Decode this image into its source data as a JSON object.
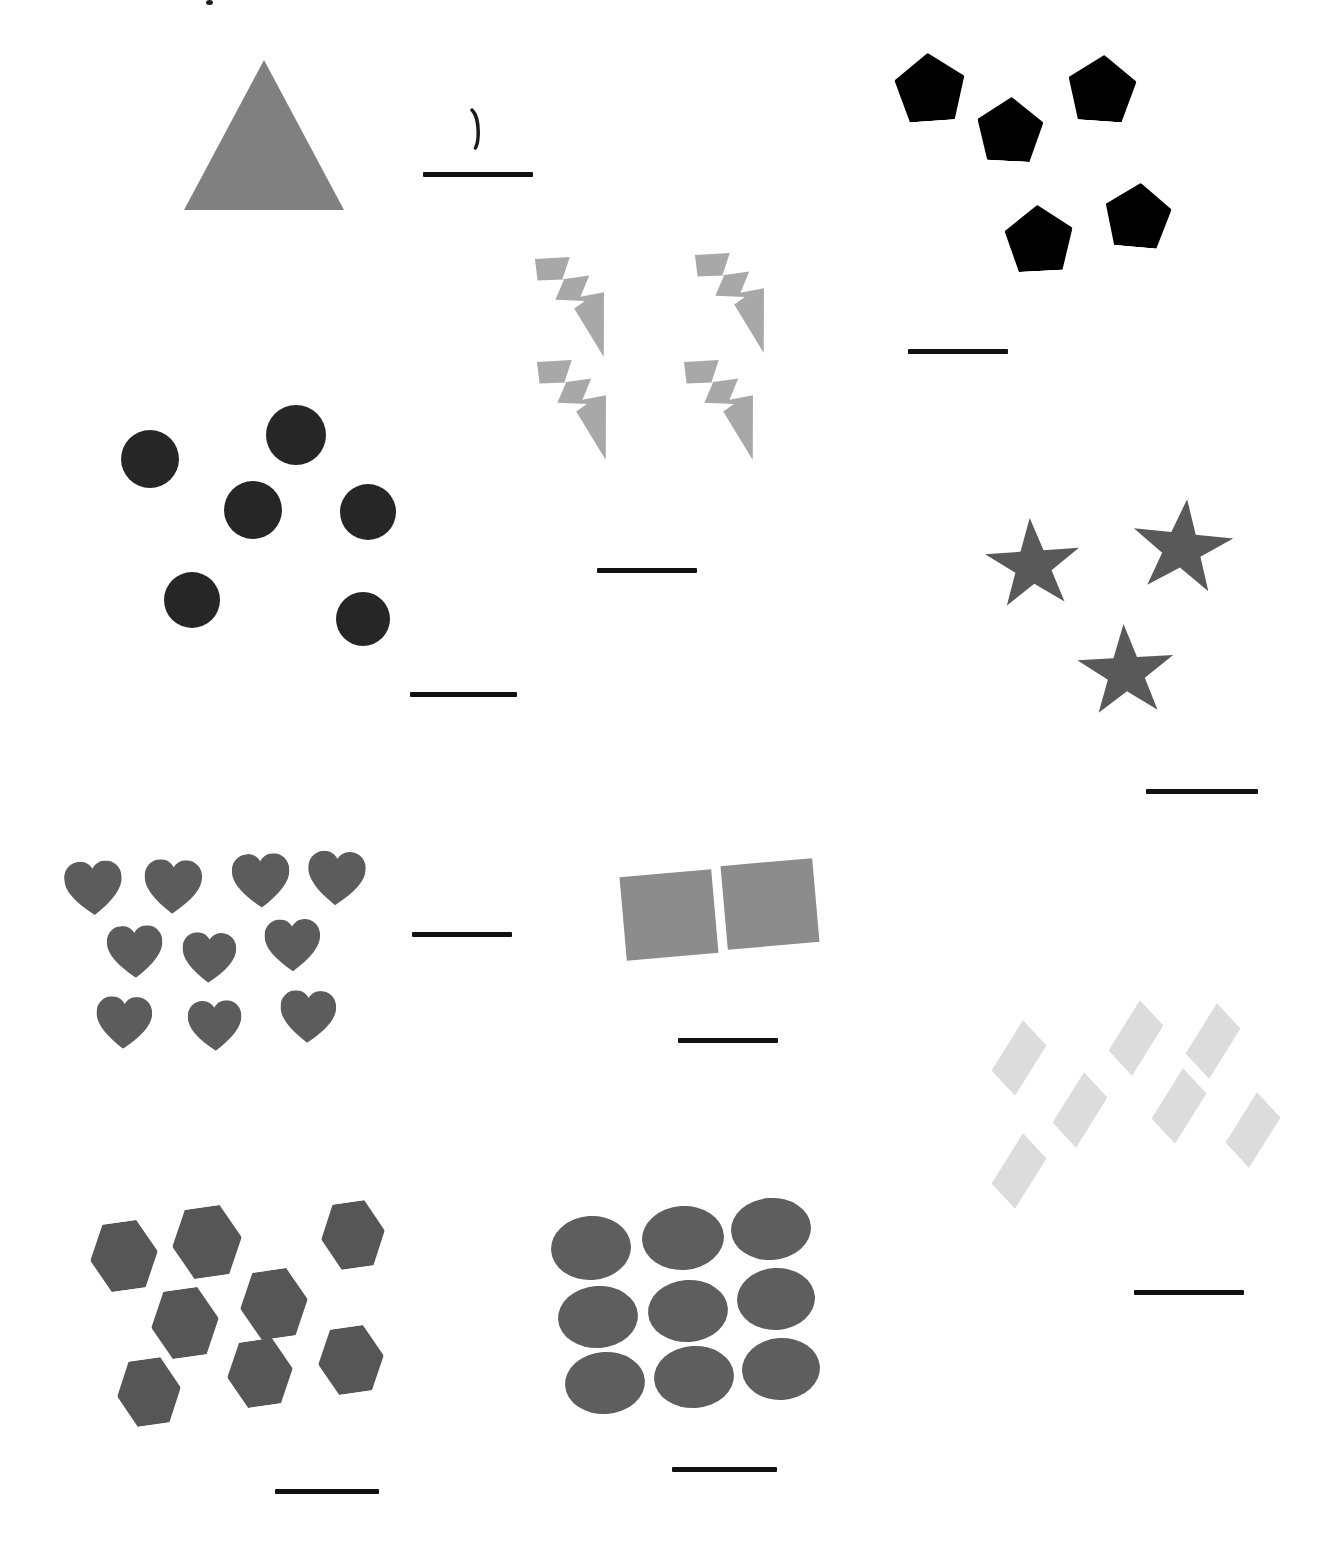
{
  "worksheet": {
    "title": "Counting Shapes Worksheet",
    "page_background": "#ffffff",
    "width": 1331,
    "height": 1554,
    "answer_line_color": "#111111"
  },
  "handwriting": {
    "mark_label": "1",
    "description": "handwritten pen stroke above first answer line",
    "color": "#1a1a1a"
  },
  "groups": [
    {
      "id": "triangle-group",
      "shape_name": "triangle",
      "shape_label": "Triangle",
      "count": 1,
      "color": "#808080",
      "answer_value": "",
      "answer_placeholder": ""
    },
    {
      "id": "pentagon-group",
      "shape_name": "pentagon",
      "shape_label": "Pentagon",
      "count": 5,
      "color": "#000000",
      "answer_value": "",
      "answer_placeholder": ""
    },
    {
      "id": "bolt-group",
      "shape_name": "lightning-bolt",
      "shape_label": "Lightning Bolt",
      "count": 4,
      "color": "#a8a8a8",
      "answer_value": "",
      "answer_placeholder": ""
    },
    {
      "id": "circle-group",
      "shape_name": "circle",
      "shape_label": "Circle",
      "count": 6,
      "color": "#262626",
      "answer_value": "",
      "answer_placeholder": ""
    },
    {
      "id": "star-group",
      "shape_name": "star",
      "shape_label": "Star",
      "count": 3,
      "color": "#595959",
      "answer_value": "",
      "answer_placeholder": ""
    },
    {
      "id": "heart-group",
      "shape_name": "heart",
      "shape_label": "Heart",
      "count": 10,
      "color": "#5c5c5c",
      "answer_value": "",
      "answer_placeholder": ""
    },
    {
      "id": "square-group",
      "shape_name": "square",
      "shape_label": "Square",
      "count": 2,
      "color": "#8c8c8c",
      "answer_value": "",
      "answer_placeholder": ""
    },
    {
      "id": "diamond-group",
      "shape_name": "diamond",
      "shape_label": "Diamond",
      "count": 7,
      "color": "#dcdcdc",
      "answer_value": "",
      "answer_placeholder": ""
    },
    {
      "id": "hexagon-group",
      "shape_name": "hexagon",
      "shape_label": "Hexagon",
      "count": 8,
      "color": "#565656",
      "answer_value": "",
      "answer_placeholder": ""
    },
    {
      "id": "ellipse-group",
      "shape_name": "ellipse",
      "shape_label": "Ellipse",
      "count": 9,
      "color": "#5e5e5e",
      "answer_value": "",
      "answer_placeholder": ""
    }
  ],
  "layout": {
    "triangle": {
      "items": [
        {
          "x": 184,
          "y": 60,
          "w": 160,
          "h": 150,
          "rot": 0
        }
      ],
      "line": {
        "x": 423,
        "y": 172,
        "w": 110
      }
    },
    "pentagon": {
      "items": [
        {
          "x": 895,
          "y": 53,
          "w": 70,
          "h": 68,
          "rot": -4
        },
        {
          "x": 977,
          "y": 97,
          "w": 66,
          "h": 64,
          "rot": 3
        },
        {
          "x": 1068,
          "y": 55,
          "w": 68,
          "h": 66,
          "rot": 4
        },
        {
          "x": 1005,
          "y": 205,
          "w": 68,
          "h": 66,
          "rot": -3
        },
        {
          "x": 1105,
          "y": 183,
          "w": 66,
          "h": 64,
          "rot": 5
        }
      ],
      "line": {
        "x": 908,
        "y": 349,
        "w": 100
      }
    },
    "bolt": {
      "items": [
        {
          "x": 527,
          "y": 257,
          "w": 82,
          "h": 96,
          "rot": 6
        },
        {
          "x": 687,
          "y": 253,
          "w": 82,
          "h": 96,
          "rot": 6
        },
        {
          "x": 529,
          "y": 360,
          "w": 82,
          "h": 96,
          "rot": 6
        },
        {
          "x": 676,
          "y": 360,
          "w": 82,
          "h": 96,
          "rot": 6
        }
      ],
      "line": {
        "x": 597,
        "y": 568,
        "w": 100
      }
    },
    "circle": {
      "items": [
        {
          "x": 121,
          "y": 430,
          "w": 58,
          "h": 58,
          "rot": 0
        },
        {
          "x": 266,
          "y": 405,
          "w": 60,
          "h": 60,
          "rot": 0
        },
        {
          "x": 224,
          "y": 481,
          "w": 58,
          "h": 58,
          "rot": 0
        },
        {
          "x": 340,
          "y": 484,
          "w": 56,
          "h": 56,
          "rot": 0
        },
        {
          "x": 164,
          "y": 572,
          "w": 56,
          "h": 56,
          "rot": 0
        },
        {
          "x": 336,
          "y": 592,
          "w": 54,
          "h": 54,
          "rot": 0
        }
      ],
      "line": {
        "x": 410,
        "y": 692,
        "w": 107
      }
    },
    "star": {
      "items": [
        {
          "x": 984,
          "y": 518,
          "w": 98,
          "h": 94,
          "rot": -4
        },
        {
          "x": 1130,
          "y": 499,
          "w": 104,
          "h": 98,
          "rot": 6
        },
        {
          "x": 1076,
          "y": 624,
          "w": 100,
          "h": 96,
          "rot": -3
        }
      ],
      "line": {
        "x": 1146,
        "y": 789,
        "w": 112
      }
    },
    "heart": {
      "items": [
        {
          "x": 62,
          "y": 861,
          "w": 60,
          "h": 58,
          "rot": -3
        },
        {
          "x": 144,
          "y": 857,
          "w": 60,
          "h": 58,
          "rot": 2
        },
        {
          "x": 230,
          "y": 853,
          "w": 60,
          "h": 58,
          "rot": -2
        },
        {
          "x": 308,
          "y": 848,
          "w": 60,
          "h": 58,
          "rot": 3
        },
        {
          "x": 105,
          "y": 925,
          "w": 58,
          "h": 56,
          "rot": -2
        },
        {
          "x": 182,
          "y": 930,
          "w": 56,
          "h": 54,
          "rot": 2
        },
        {
          "x": 263,
          "y": 918,
          "w": 58,
          "h": 56,
          "rot": -1
        },
        {
          "x": 96,
          "y": 994,
          "w": 58,
          "h": 56,
          "rot": 2
        },
        {
          "x": 186,
          "y": 1000,
          "w": 56,
          "h": 54,
          "rot": -2
        },
        {
          "x": 280,
          "y": 988,
          "w": 58,
          "h": 56,
          "rot": 2
        }
      ],
      "line": {
        "x": 412,
        "y": 932,
        "w": 100
      }
    },
    "square": {
      "items": [
        {
          "x": 623,
          "y": 873,
          "w": 92,
          "h": 84,
          "rot": -5
        },
        {
          "x": 724,
          "y": 862,
          "w": 92,
          "h": 84,
          "rot": -5
        }
      ],
      "line": {
        "x": 678,
        "y": 1038,
        "w": 100
      }
    },
    "diamond": {
      "items": [
        {
          "x": 993,
          "y": 1020,
          "w": 52,
          "h": 76,
          "rot": 6
        },
        {
          "x": 1110,
          "y": 1000,
          "w": 52,
          "h": 76,
          "rot": 6
        },
        {
          "x": 1187,
          "y": 1003,
          "w": 52,
          "h": 76,
          "rot": 6
        },
        {
          "x": 1054,
          "y": 1072,
          "w": 52,
          "h": 76,
          "rot": 6
        },
        {
          "x": 1153,
          "y": 1068,
          "w": 52,
          "h": 76,
          "rot": 6
        },
        {
          "x": 1227,
          "y": 1092,
          "w": 52,
          "h": 76,
          "rot": 6
        },
        {
          "x": 993,
          "y": 1133,
          "w": 52,
          "h": 76,
          "rot": 6
        }
      ],
      "line": {
        "x": 1134,
        "y": 1290,
        "w": 110
      }
    },
    "hexagon": {
      "items": [
        {
          "x": 90,
          "y": 1220,
          "w": 68,
          "h": 72,
          "rot": -8
        },
        {
          "x": 172,
          "y": 1205,
          "w": 70,
          "h": 74,
          "rot": -8
        },
        {
          "x": 321,
          "y": 1200,
          "w": 64,
          "h": 70,
          "rot": -8
        },
        {
          "x": 151,
          "y": 1287,
          "w": 68,
          "h": 72,
          "rot": -8
        },
        {
          "x": 240,
          "y": 1268,
          "w": 68,
          "h": 72,
          "rot": -8
        },
        {
          "x": 227,
          "y": 1338,
          "w": 66,
          "h": 70,
          "rot": -8
        },
        {
          "x": 318,
          "y": 1325,
          "w": 66,
          "h": 70,
          "rot": -8
        },
        {
          "x": 117,
          "y": 1357,
          "w": 64,
          "h": 70,
          "rot": -8
        }
      ],
      "line": {
        "x": 275,
        "y": 1489,
        "w": 104
      }
    },
    "ellipse": {
      "items": [
        {
          "x": 551,
          "y": 1216,
          "w": 80,
          "h": 64,
          "rot": -4
        },
        {
          "x": 642,
          "y": 1206,
          "w": 82,
          "h": 64,
          "rot": -4
        },
        {
          "x": 731,
          "y": 1198,
          "w": 80,
          "h": 62,
          "rot": -4
        },
        {
          "x": 558,
          "y": 1286,
          "w": 80,
          "h": 62,
          "rot": -4
        },
        {
          "x": 648,
          "y": 1280,
          "w": 80,
          "h": 62,
          "rot": -4
        },
        {
          "x": 737,
          "y": 1268,
          "w": 78,
          "h": 62,
          "rot": -4
        },
        {
          "x": 565,
          "y": 1352,
          "w": 80,
          "h": 62,
          "rot": -4
        },
        {
          "x": 654,
          "y": 1346,
          "w": 80,
          "h": 62,
          "rot": -4
        },
        {
          "x": 742,
          "y": 1338,
          "w": 78,
          "h": 62,
          "rot": -4
        }
      ],
      "line": {
        "x": 672,
        "y": 1467,
        "w": 105
      }
    }
  }
}
